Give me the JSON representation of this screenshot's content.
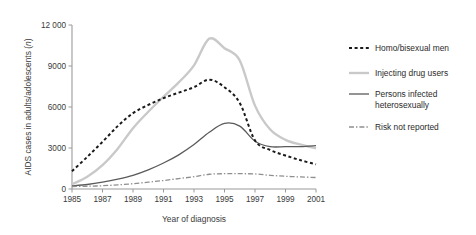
{
  "chart_data": {
    "type": "line",
    "title": "",
    "xlabel": "Year of diagnosis",
    "ylabel": "AIDS cases in adults/adolescents (n)",
    "ylabel_main": "AIDS cases in adults/adolescents (",
    "ylabel_italic": "n",
    "ylabel_tail": ")",
    "x": [
      1985,
      1986,
      1987,
      1988,
      1989,
      1990,
      1991,
      1992,
      1993,
      1994,
      1995,
      1996,
      1997,
      1998,
      1999,
      2000,
      2001
    ],
    "xlim": [
      1985,
      2001
    ],
    "ylim": [
      0,
      12000
    ],
    "xtick_labels": [
      "1985",
      "1987",
      "1989",
      "1991",
      "1993",
      "1995",
      "1997",
      "1999",
      "2001"
    ],
    "xticks": [
      1985,
      1987,
      1989,
      1991,
      1993,
      1995,
      1997,
      1999,
      2001
    ],
    "ytick_labels": [
      "0",
      "3000",
      "6000",
      "9000",
      "12 000"
    ],
    "yticks": [
      0,
      3000,
      6000,
      9000,
      12000
    ],
    "grid": false,
    "legend_position": "right",
    "series": [
      {
        "name": "Homo/bisexual men",
        "style": "dotted",
        "color": "#1a1a1a",
        "width": 2.0,
        "dash": "3,2.6",
        "values": [
          1300,
          2350,
          3450,
          4600,
          5550,
          6150,
          6650,
          7050,
          7450,
          8000,
          7450,
          6300,
          3550,
          2850,
          2450,
          2100,
          1800
        ]
      },
      {
        "name": "Injecting drug users",
        "style": "solid",
        "color": "#c9c9c9",
        "width": 2.4,
        "dash": "",
        "values": [
          350,
          900,
          1750,
          2950,
          4450,
          5650,
          6750,
          7800,
          9050,
          11000,
          10300,
          9400,
          6100,
          4350,
          3600,
          3250,
          2980
        ]
      },
      {
        "name": "Persons infected heterosexually",
        "style": "solid",
        "color": "#5a5a5a",
        "width": 1.3,
        "dash": "",
        "values": [
          220,
          330,
          500,
          720,
          1000,
          1400,
          1900,
          2500,
          3250,
          4150,
          4800,
          4600,
          3500,
          3100,
          3100,
          3100,
          3180
        ]
      },
      {
        "name": "Risk not reported",
        "style": "dashdot",
        "color": "#8f8f8f",
        "width": 1.3,
        "dash": "5,2,1.4,2",
        "values": [
          180,
          200,
          240,
          300,
          390,
          500,
          620,
          760,
          900,
          1080,
          1120,
          1120,
          1100,
          1000,
          930,
          880,
          840
        ]
      }
    ]
  },
  "legend": {
    "entries": [
      {
        "label": "Homo/bisexual men",
        "label2": ""
      },
      {
        "label": "Injecting drug users",
        "label2": ""
      },
      {
        "label": "Persons infected",
        "label2": "heterosexually"
      },
      {
        "label": "Risk not reported",
        "label2": ""
      }
    ]
  }
}
